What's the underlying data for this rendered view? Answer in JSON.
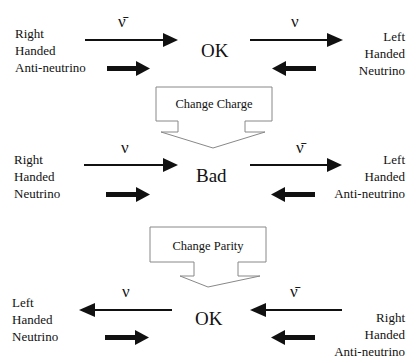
{
  "rows": [
    {
      "left_label": [
        "Right",
        "Handed",
        "Anti-neutrino"
      ],
      "left_symbol": "ν̄",
      "center": "OK",
      "right_symbol": "ν",
      "right_label": [
        "Left",
        "Handed",
        "Neutrino"
      ]
    },
    {
      "left_label": [
        "Right",
        "Handed",
        "Neutrino"
      ],
      "left_symbol": "ν",
      "center": "Bad",
      "right_symbol": "ν̄",
      "right_label": [
        "Left",
        "Handed",
        "Anti-neutrino"
      ]
    },
    {
      "left_label": [
        "Left",
        "Handed",
        "Neutrino"
      ],
      "left_symbol": "ν",
      "center": "OK",
      "right_symbol": "ν̄",
      "right_label": [
        "Right",
        "Handed",
        "Anti-neutrino"
      ]
    }
  ],
  "transforms": [
    {
      "label": "Change Charge"
    },
    {
      "label": "Change Parity"
    }
  ]
}
